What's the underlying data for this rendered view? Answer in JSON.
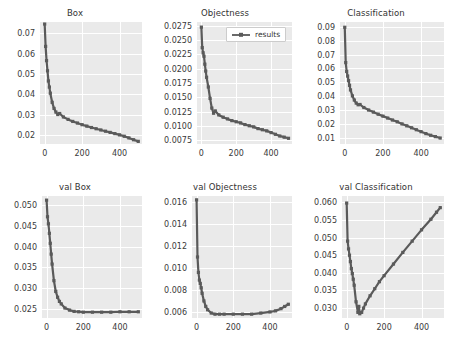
{
  "figure": {
    "background": "#ffffff",
    "plot_background": "#eaeaea",
    "grid_color": "#ffffff",
    "line_color": "#5a5a5a",
    "tick_color": "#3a3a3a",
    "width": 452,
    "height": 348
  },
  "legend": {
    "label": "results",
    "panel": "Objectness",
    "position": "upper-right"
  },
  "chart_data": [
    {
      "type": "line",
      "title": "Box",
      "xlabel": "",
      "ylabel": "",
      "xlim": [
        -25,
        520
      ],
      "ylim": [
        0.0155,
        0.0755
      ],
      "xticks": [
        0,
        200,
        400
      ],
      "yticks": [
        0.02,
        0.03,
        0.04,
        0.05,
        0.06,
        0.07
      ],
      "ytick_labels": [
        "0.02",
        "0.03",
        "0.04",
        "0.05",
        "0.06",
        "0.07"
      ],
      "grid": true,
      "legend": null,
      "series": [
        {
          "name": "results",
          "x": [
            0,
            5,
            10,
            15,
            20,
            25,
            30,
            40,
            50,
            60,
            70,
            80,
            100,
            125,
            150,
            175,
            200,
            225,
            250,
            275,
            300,
            325,
            350,
            375,
            400,
            425,
            450,
            475,
            500
          ],
          "values": [
            0.0745,
            0.0635,
            0.0565,
            0.0515,
            0.0465,
            0.0435,
            0.0405,
            0.036,
            0.033,
            0.0312,
            0.03,
            0.0305,
            0.0288,
            0.0276,
            0.0266,
            0.0258,
            0.025,
            0.0243,
            0.0236,
            0.023,
            0.0224,
            0.0218,
            0.0212,
            0.0206,
            0.02,
            0.0193,
            0.0185,
            0.0176,
            0.0168
          ]
        }
      ]
    },
    {
      "type": "line",
      "title": "Objectness",
      "xlabel": "",
      "ylabel": "",
      "xlim": [
        -25,
        520
      ],
      "ylim": [
        0.0068,
        0.0282
      ],
      "xticks": [
        0,
        200,
        400
      ],
      "yticks": [
        0.0075,
        0.01,
        0.0125,
        0.015,
        0.0175,
        0.02,
        0.0225,
        0.025,
        0.0275
      ],
      "ytick_labels": [
        "0.0075",
        "0.0100",
        "0.0125",
        "0.0150",
        "0.0175",
        "0.0200",
        "0.0225",
        "0.0250",
        "0.0275"
      ],
      "grid": true,
      "legend": "results",
      "series": [
        {
          "name": "results",
          "x": [
            0,
            5,
            10,
            15,
            20,
            25,
            30,
            40,
            50,
            60,
            70,
            80,
            100,
            125,
            150,
            175,
            200,
            225,
            250,
            275,
            300,
            325,
            350,
            375,
            400,
            425,
            450,
            475,
            500
          ],
          "values": [
            0.0273,
            0.0237,
            0.0228,
            0.0222,
            0.0208,
            0.0196,
            0.0185,
            0.0168,
            0.0148,
            0.0131,
            0.0122,
            0.0126,
            0.0119,
            0.0115,
            0.0112,
            0.0109,
            0.0107,
            0.0105,
            0.0102,
            0.01,
            0.0098,
            0.0095,
            0.0093,
            0.0091,
            0.0088,
            0.0085,
            0.0082,
            0.008,
            0.0078
          ]
        }
      ]
    },
    {
      "type": "line",
      "title": "Classification",
      "xlabel": "",
      "ylabel": "",
      "xlim": [
        -25,
        520
      ],
      "ylim": [
        0.0055,
        0.0935
      ],
      "xticks": [
        0,
        200,
        400
      ],
      "yticks": [
        0.01,
        0.02,
        0.03,
        0.04,
        0.05,
        0.06,
        0.07,
        0.08,
        0.09
      ],
      "ytick_labels": [
        "0.01",
        "0.02",
        "0.03",
        "0.04",
        "0.05",
        "0.06",
        "0.07",
        "0.08",
        "0.09"
      ],
      "grid": true,
      "legend": null,
      "series": [
        {
          "name": "results",
          "x": [
            0,
            5,
            10,
            15,
            20,
            25,
            30,
            40,
            50,
            60,
            70,
            80,
            100,
            125,
            150,
            175,
            200,
            225,
            250,
            275,
            300,
            325,
            350,
            375,
            400,
            425,
            450,
            475,
            500
          ],
          "values": [
            0.0897,
            0.0642,
            0.0578,
            0.0545,
            0.0512,
            0.0478,
            0.0445,
            0.0402,
            0.0372,
            0.035,
            0.0338,
            0.034,
            0.0318,
            0.03,
            0.0285,
            0.027,
            0.0256,
            0.0242,
            0.0228,
            0.0215,
            0.02,
            0.0186,
            0.0172,
            0.0158,
            0.0144,
            0.013,
            0.0118,
            0.0108,
            0.0098
          ]
        }
      ]
    },
    {
      "type": "line",
      "title": "val Box",
      "xlabel": "",
      "ylabel": "",
      "xlim": [
        -25,
        520
      ],
      "ylim": [
        0.0228,
        0.0522
      ],
      "xticks": [
        0,
        200,
        400
      ],
      "yticks": [
        0.025,
        0.03,
        0.035,
        0.04,
        0.045,
        0.05
      ],
      "ytick_labels": [
        "0.025",
        "0.030",
        "0.035",
        "0.040",
        "0.045",
        "0.050"
      ],
      "grid": true,
      "legend": null,
      "series": [
        {
          "name": "results",
          "x": [
            0,
            5,
            10,
            15,
            20,
            25,
            30,
            40,
            50,
            60,
            70,
            80,
            100,
            125,
            150,
            175,
            200,
            250,
            300,
            350,
            400,
            450,
            500
          ],
          "values": [
            0.0512,
            0.0472,
            0.0455,
            0.0432,
            0.0408,
            0.0382,
            0.0358,
            0.0318,
            0.0292,
            0.0278,
            0.0268,
            0.0262,
            0.0252,
            0.0247,
            0.0244,
            0.0243,
            0.0242,
            0.0242,
            0.0242,
            0.0242,
            0.0243,
            0.0243,
            0.0243
          ]
        }
      ]
    },
    {
      "type": "line",
      "title": "val Objectness",
      "xlabel": "",
      "ylabel": "",
      "xlim": [
        -25,
        520
      ],
      "ylim": [
        0.00545,
        0.01655
      ],
      "xticks": [
        0,
        200,
        400
      ],
      "yticks": [
        0.006,
        0.008,
        0.01,
        0.012,
        0.014,
        0.016
      ],
      "ytick_labels": [
        "0.006",
        "0.008",
        "0.010",
        "0.012",
        "0.014",
        "0.016"
      ],
      "grid": true,
      "legend": null,
      "series": [
        {
          "name": "results",
          "x": [
            0,
            5,
            10,
            15,
            20,
            25,
            30,
            40,
            50,
            60,
            80,
            100,
            125,
            150,
            200,
            250,
            300,
            350,
            400,
            430,
            460,
            480,
            500
          ],
          "values": [
            0.0162,
            0.011,
            0.0096,
            0.0089,
            0.0086,
            0.0082,
            0.0077,
            0.007,
            0.0065,
            0.0062,
            0.0059,
            0.0058,
            0.0058,
            0.0058,
            0.0058,
            0.0058,
            0.0058,
            0.0059,
            0.006,
            0.0061,
            0.0063,
            0.0065,
            0.0067
          ]
        }
      ]
    },
    {
      "type": "line",
      "title": "val Classification",
      "xlabel": "",
      "ylabel": "",
      "xlim": [
        -25,
        520
      ],
      "ylim": [
        0.0272,
        0.0618
      ],
      "xticks": [
        0,
        200,
        400
      ],
      "yticks": [
        0.03,
        0.035,
        0.04,
        0.045,
        0.05,
        0.055,
        0.06
      ],
      "ytick_labels": [
        "0.030",
        "0.035",
        "0.040",
        "0.045",
        "0.050",
        "0.055",
        "0.060"
      ],
      "grid": true,
      "legend": null,
      "series": [
        {
          "name": "results",
          "x": [
            0,
            5,
            10,
            15,
            20,
            25,
            30,
            35,
            40,
            50,
            60,
            65,
            70,
            80,
            90,
            100,
            125,
            150,
            175,
            200,
            250,
            300,
            350,
            400,
            450,
            480,
            500
          ],
          "values": [
            0.0598,
            0.049,
            0.0468,
            0.045,
            0.0432,
            0.0412,
            0.0398,
            0.0382,
            0.0365,
            0.0318,
            0.0288,
            0.0305,
            0.0284,
            0.0288,
            0.03,
            0.0312,
            0.0335,
            0.0355,
            0.0375,
            0.0392,
            0.0425,
            0.0458,
            0.049,
            0.0522,
            0.0552,
            0.0572,
            0.0585
          ]
        }
      ]
    }
  ]
}
